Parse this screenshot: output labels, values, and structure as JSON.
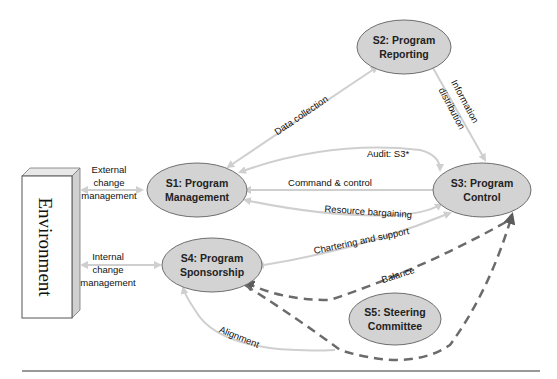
{
  "diagram": {
    "environment": {
      "label": "Environment"
    },
    "nodes": [
      {
        "id": "S1",
        "line1": "S1: Program",
        "line2": "Management"
      },
      {
        "id": "S2",
        "line1": "S2: Program",
        "line2": "Reporting"
      },
      {
        "id": "S3",
        "line1": "S3: Program",
        "line2": "Control"
      },
      {
        "id": "S4",
        "line1": "S4: Program",
        "line2": "Sponsorship"
      },
      {
        "id": "S5",
        "line1": "S5: Steering",
        "line2": "Committee"
      }
    ],
    "edges": {
      "external": {
        "line1": "External",
        "line2": "change",
        "line3": "management"
      },
      "internal": {
        "line1": "Internal",
        "line2": "change",
        "line3": "management"
      },
      "data_collection": "Data collection",
      "information_distribution": {
        "line1": "Information",
        "line2": "distribution"
      },
      "audit": "Audit: S3*",
      "command_control": "Command & control",
      "resource_bargaining": "Resource bargaining",
      "chartering_support": "Chartering and support",
      "balance": "Balance",
      "alignment": "Alignment"
    },
    "colors": {
      "node_fill": "#d3d3d3",
      "node_stroke": "#6e6e6e",
      "arrow_light": "#cfcfcf",
      "arrow_dashed": "#6b6b6b",
      "rule": "#333333"
    }
  }
}
